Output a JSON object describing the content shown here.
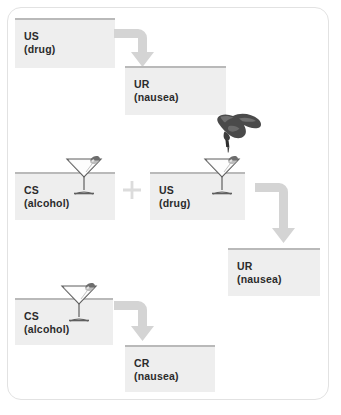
{
  "diagram": {
    "frame_color": "#e2e2e2",
    "box_fill": "#eeeeee",
    "box_rule_color": "#b9b9b9",
    "arrow_color": "#d4d4d4",
    "plus_color": "#dddddd",
    "text_color": "#2b2b2b"
  },
  "boxes": [
    {
      "id": "us-top",
      "label": "US",
      "sublabel": "(drug)",
      "has_glass": false
    },
    {
      "id": "ur-top",
      "label": "UR",
      "sublabel": "(nausea)",
      "has_glass": false
    },
    {
      "id": "cs-mid",
      "label": "CS",
      "sublabel": "(alcohol)",
      "has_glass": true
    },
    {
      "id": "us-mid",
      "label": "US",
      "sublabel": "(drug)",
      "has_glass": true
    },
    {
      "id": "ur-bottom",
      "label": "UR",
      "sublabel": "(nausea)",
      "has_glass": false
    },
    {
      "id": "cs-bottom",
      "label": "CS",
      "sublabel": "(alcohol)",
      "has_glass": true
    },
    {
      "id": "cr-bottom",
      "label": "CR",
      "sublabel": "(nausea)",
      "has_glass": true
    }
  ],
  "connectors": [
    {
      "id": "arrow-1",
      "type": "elbow-right-down",
      "from": "us-top",
      "to": "ur-top"
    },
    {
      "id": "arrow-2",
      "type": "elbow-right-down",
      "from": "us-mid",
      "to": "ur-bottom"
    },
    {
      "id": "arrow-3",
      "type": "elbow-right-down",
      "from": "cs-bottom",
      "to": "cr-bottom"
    }
  ],
  "operators": [
    {
      "id": "plus-sign",
      "symbol": "+",
      "between": [
        "cs-mid",
        "us-mid"
      ]
    }
  ],
  "images": [
    {
      "id": "glass-cs-mid",
      "name": "martini-glass"
    },
    {
      "id": "glass-us-mid",
      "name": "martini-glass"
    },
    {
      "id": "glass-cs-bottom",
      "name": "martini-glass"
    },
    {
      "id": "hand-dropper",
      "name": "hand-pouring-dropper"
    }
  ]
}
